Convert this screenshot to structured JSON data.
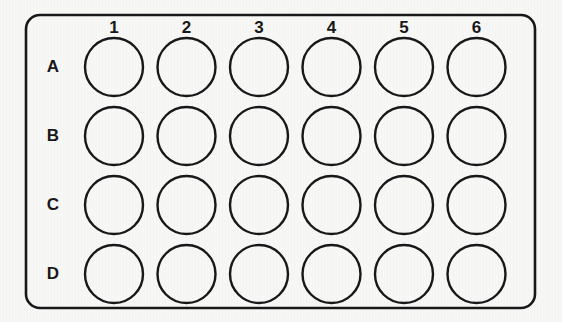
{
  "figure": {
    "name": "microplate-diagram",
    "background_color": "#f7f7f5",
    "line_color": "#18181a"
  },
  "plate": {
    "outline_name": "plate-outline",
    "rows": 4,
    "columns": 6,
    "well_count": 24,
    "corner_radius": 14,
    "bounds": {
      "x": 26,
      "y": 15,
      "width": 509,
      "height": 293
    },
    "well_diameter": 58,
    "pitch_x": 72.5,
    "pitch_y": 69,
    "first_well_center": {
      "x": 114,
      "y": 67
    }
  },
  "column_labels": [
    "1",
    "2",
    "3",
    "4",
    "5",
    "6"
  ],
  "row_labels": [
    "A",
    "B",
    "C",
    "D"
  ],
  "wells": [
    {
      "id": "A1",
      "row": "A",
      "column": "1",
      "filled": false
    },
    {
      "id": "A2",
      "row": "A",
      "column": "2",
      "filled": false
    },
    {
      "id": "A3",
      "row": "A",
      "column": "3",
      "filled": false
    },
    {
      "id": "A4",
      "row": "A",
      "column": "4",
      "filled": false
    },
    {
      "id": "A5",
      "row": "A",
      "column": "5",
      "filled": false
    },
    {
      "id": "A6",
      "row": "A",
      "column": "6",
      "filled": false
    },
    {
      "id": "B1",
      "row": "B",
      "column": "1",
      "filled": false
    },
    {
      "id": "B2",
      "row": "B",
      "column": "2",
      "filled": false
    },
    {
      "id": "B3",
      "row": "B",
      "column": "3",
      "filled": false
    },
    {
      "id": "B4",
      "row": "B",
      "column": "4",
      "filled": false
    },
    {
      "id": "B5",
      "row": "B",
      "column": "5",
      "filled": false
    },
    {
      "id": "B6",
      "row": "B",
      "column": "6",
      "filled": false
    },
    {
      "id": "C1",
      "row": "C",
      "column": "1",
      "filled": false
    },
    {
      "id": "C2",
      "row": "C",
      "column": "2",
      "filled": false
    },
    {
      "id": "C3",
      "row": "C",
      "column": "3",
      "filled": false
    },
    {
      "id": "C4",
      "row": "C",
      "column": "4",
      "filled": false
    },
    {
      "id": "C5",
      "row": "C",
      "column": "5",
      "filled": false
    },
    {
      "id": "C6",
      "row": "C",
      "column": "6",
      "filled": false
    },
    {
      "id": "D1",
      "row": "D",
      "column": "1",
      "filled": false
    },
    {
      "id": "D2",
      "row": "D",
      "column": "2",
      "filled": false
    },
    {
      "id": "D3",
      "row": "D",
      "column": "3",
      "filled": false
    },
    {
      "id": "D4",
      "row": "D",
      "column": "4",
      "filled": false
    },
    {
      "id": "D5",
      "row": "D",
      "column": "5",
      "filled": false
    },
    {
      "id": "D6",
      "row": "D",
      "column": "6",
      "filled": false
    }
  ]
}
